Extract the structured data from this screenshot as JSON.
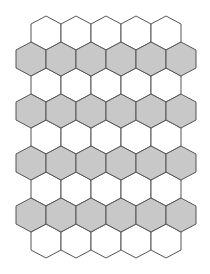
{
  "diagram": {
    "type": "hexagonal-tiling",
    "hex": {
      "width": 30,
      "height": 34,
      "tip": 8,
      "row_step": 26
    },
    "colors": {
      "white": "#ffffff",
      "gray": "#c8c8c8",
      "stroke": "#555555"
    },
    "rows": [
      {
        "fill": "white",
        "top": 16,
        "centers": [
          46,
          76,
          106,
          136,
          166
        ]
      },
      {
        "fill": "gray",
        "top": 42,
        "centers": [
          31,
          61,
          91,
          121,
          151,
          181
        ]
      },
      {
        "fill": "white",
        "top": 68,
        "centers": [
          46,
          76,
          106,
          136,
          166
        ]
      },
      {
        "fill": "gray",
        "top": 94,
        "centers": [
          31,
          61,
          91,
          121,
          151,
          181
        ]
      },
      {
        "fill": "white",
        "top": 120,
        "centers": [
          46,
          76,
          106,
          136,
          166
        ]
      },
      {
        "fill": "gray",
        "top": 146,
        "centers": [
          31,
          61,
          91,
          121,
          151,
          181
        ]
      },
      {
        "fill": "white",
        "top": 172,
        "centers": [
          46,
          76,
          106,
          136,
          166
        ]
      },
      {
        "fill": "gray",
        "top": 198,
        "centers": [
          31,
          61,
          91,
          121,
          151,
          181
        ]
      },
      {
        "fill": "white",
        "top": 224,
        "centers": [
          46,
          76,
          106,
          136,
          166
        ]
      }
    ]
  }
}
